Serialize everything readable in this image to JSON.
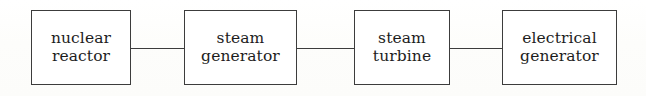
{
  "diagram": {
    "type": "block-flow-diagram",
    "canvas": {
      "width": 646,
      "height": 96,
      "background": "#fdfdfc"
    },
    "style": {
      "border_color": "#3c3c3c",
      "text_color": "#1d1d1d",
      "box_fill": "#ffffff"
    },
    "nodes": [
      {
        "id": "nuclear-reactor",
        "line1": "nuclear",
        "line2": "reactor",
        "x": 31,
        "y": 10,
        "width": 100,
        "height": 75
      },
      {
        "id": "steam-generator",
        "line1": "steam",
        "line2": "generator",
        "x": 184,
        "y": 10,
        "width": 113,
        "height": 75
      },
      {
        "id": "steam-turbine",
        "line1": "steam",
        "line2": "turbine",
        "x": 354,
        "y": 10,
        "width": 96,
        "height": 75
      },
      {
        "id": "electrical-generator",
        "line1": "electrical",
        "line2": "generator",
        "x": 502,
        "y": 10,
        "width": 115,
        "height": 75
      }
    ],
    "connectors": [
      {
        "id": "reactor-to-generator",
        "from": "nuclear-reactor",
        "to": "steam-generator",
        "x": 131,
        "y": 48,
        "length": 53
      },
      {
        "id": "generator-to-turbine",
        "from": "steam-generator",
        "to": "steam-turbine",
        "x": 297,
        "y": 48,
        "length": 57
      },
      {
        "id": "turbine-to-electrical",
        "from": "steam-turbine",
        "to": "electrical-generator",
        "x": 450,
        "y": 48,
        "length": 52
      }
    ]
  }
}
